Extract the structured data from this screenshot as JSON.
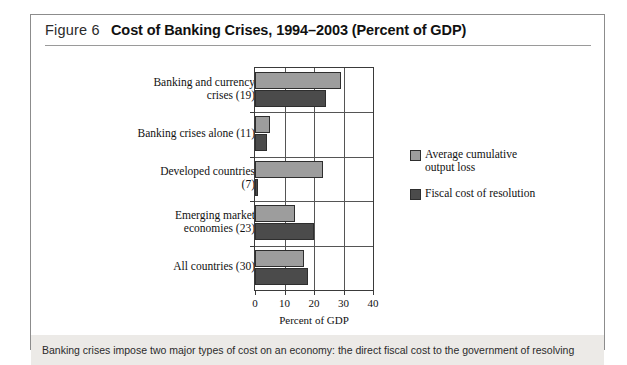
{
  "figure": {
    "number": "Figure 6",
    "title": "Cost of Banking Crises, 1994–2003 (Percent of GDP)",
    "footnote": "Banking crises impose two major types of cost on an economy: the direct fiscal cost to the government of resolving"
  },
  "chart_data": {
    "type": "bar",
    "orientation": "horizontal",
    "title": "Cost of Banking Crises, 1994–2003 (Percent of GDP)",
    "xlabel": "Percent of GDP",
    "ylabel": "",
    "xlim": [
      0,
      40
    ],
    "xticks": [
      0,
      10,
      20,
      30,
      40
    ],
    "xticklabels": [
      "0",
      "10",
      "20",
      "30",
      "40"
    ],
    "grid": true,
    "legend_position": "right",
    "categories": [
      "Banking and currency crises (19)",
      "Banking crises alone (11)",
      "Developed countries (7)",
      "Emerging market economies (23)",
      "All countries (30)"
    ],
    "series": [
      {
        "name": "Average cumulative output loss",
        "color": "#9d9d9d",
        "values": [
          29,
          5,
          23,
          13.5,
          16.5
        ]
      },
      {
        "name": "Fiscal cost of resolution",
        "color": "#4b4b4b",
        "values": [
          24,
          4,
          1,
          20,
          18
        ]
      }
    ]
  },
  "legend": [
    {
      "label_line1": "Average cumulative",
      "label_line2": "output loss"
    },
    {
      "label_line1": "Fiscal cost of resolution",
      "label_line2": ""
    }
  ],
  "category_labels": [
    {
      "line1": "Banking and currency",
      "line2": "crises (19)"
    },
    {
      "line1": "Banking crises alone (11)",
      "line2": ""
    },
    {
      "line1": "Developed countries",
      "line2": "(7)"
    },
    {
      "line1": "Emerging market",
      "line2": "economies (23)"
    },
    {
      "line1": "All countries (30)",
      "line2": ""
    }
  ]
}
